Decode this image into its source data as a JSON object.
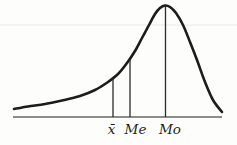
{
  "figure": {
    "kind": "left-skewed-distribution-curve",
    "curve_points": [
      [
        14,
        109
      ],
      [
        28,
        106.5
      ],
      [
        45,
        104
      ],
      [
        62,
        100.5
      ],
      [
        80,
        96
      ],
      [
        95,
        90
      ],
      [
        108,
        82
      ],
      [
        118,
        74
      ],
      [
        127,
        63
      ],
      [
        135,
        51
      ],
      [
        142,
        38
      ],
      [
        149,
        25
      ],
      [
        155,
        14
      ],
      [
        160,
        8
      ],
      [
        165,
        5.5
      ],
      [
        170,
        7
      ],
      [
        176,
        13
      ],
      [
        183,
        25
      ],
      [
        190,
        42
      ],
      [
        197,
        60
      ],
      [
        205,
        82
      ],
      [
        213,
        100
      ],
      [
        222,
        112
      ]
    ],
    "baseline": {
      "x1": 13,
      "x2": 222,
      "y": 117
    },
    "artifact_line": {
      "x1": 0,
      "x2": 237,
      "y": 25
    },
    "label_baseline_y": 134,
    "markers": [
      {
        "label": "x̄",
        "x": 113,
        "top": 78,
        "label_x": 111.5
      },
      {
        "label": "Me",
        "x": 130,
        "top": 59,
        "label_x": 135.5
      },
      {
        "label": "Mo",
        "x": 165.5,
        "top": 6,
        "label_x": 170
      }
    ]
  },
  "colors": {
    "background": "#fdfdfb",
    "curve": "#1c1c1c",
    "baseline": "#8c8c8c",
    "marker_line": "#2b2b2b",
    "label_text": "#1f1f1f",
    "artifact": "#e9e9e3"
  }
}
